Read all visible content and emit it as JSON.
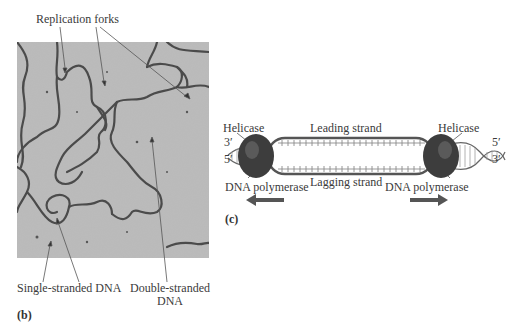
{
  "panel_b": {
    "label": "(b)",
    "annotations": {
      "replication_forks": "Replication forks",
      "single_stranded": "Single-stranded DNA",
      "double_stranded_line1": "Double-stranded",
      "double_stranded_line2": "DNA"
    }
  },
  "panel_c": {
    "label": "(c)",
    "leading_strand": "Leading strand",
    "lagging_strand": "Lagging strand",
    "helicase_left": "Helicase",
    "helicase_right": "Helicase",
    "polymerase_left": "DNA polymerase",
    "polymerase_right": "DNA polymerase",
    "left_top_end": "3′",
    "left_bottom_end": "5′",
    "right_top_end": "5′",
    "right_bottom_end": "3′"
  },
  "colors": {
    "micrograph_bg": "#b9b9b9",
    "dna_strand": "#4a4a4a",
    "helicase": "#3a3a3a",
    "arrow": "#555555"
  }
}
